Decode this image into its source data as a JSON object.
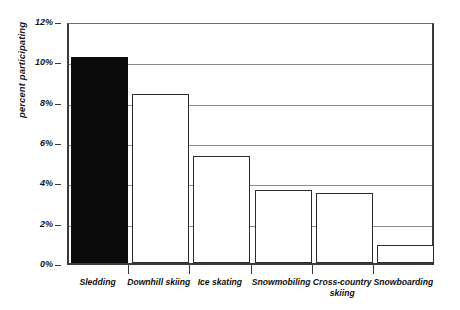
{
  "chart_data": {
    "type": "bar",
    "title": "",
    "subtitle": "",
    "xlabel": "",
    "ylabel": "percent participating",
    "categories": [
      "Sledding",
      "Downhill skiing",
      "Ice skating",
      "Snowmobiling",
      "Cross-country skiing",
      "Snowboarding"
    ],
    "values": [
      10.2,
      8.4,
      5.3,
      3.6,
      3.45,
      0.9
    ],
    "ylim": [
      0,
      12
    ],
    "ytick_labels": [
      "0%",
      "2%",
      "4%",
      "6%",
      "8%",
      "10%",
      "12%"
    ],
    "ytick_values": [
      0,
      2,
      4,
      6,
      8,
      10,
      12
    ],
    "grid": true,
    "legend": false,
    "legend_position": "none",
    "bar_fill_colors": [
      "#0b0b0b",
      "#ffffff",
      "#ffffff",
      "#ffffff",
      "#ffffff",
      "#ffffff"
    ],
    "bar_edge_color": "#2b2b2b",
    "gridline_color": "#8c8c8c",
    "axis_color": "#3a3a3a",
    "annotations": []
  },
  "axis": {
    "y_title": "percent participating",
    "x_label_lines": [
      [
        "Sledding"
      ],
      [
        "Downhill skiing"
      ],
      [
        "Ice skating"
      ],
      [
        "Snowmobiling"
      ],
      [
        "Cross-country",
        "skiing"
      ],
      [
        "Snowboarding"
      ]
    ]
  }
}
